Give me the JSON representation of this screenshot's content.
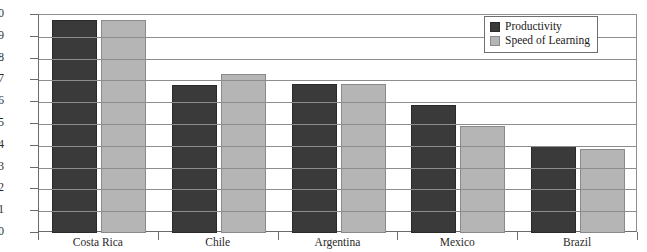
{
  "chart_data": {
    "type": "bar",
    "title": "",
    "subtitle": "",
    "xlabel": "",
    "ylabel": "",
    "ylim": [
      0,
      10
    ],
    "ytick_step": 1,
    "yticks": [
      "10",
      "9",
      "8",
      "7",
      "6",
      "5",
      "4",
      "3",
      "2",
      "1",
      "0"
    ],
    "grid": true,
    "legend_position": "top-right",
    "categories": [
      "Costa Rica",
      "Chile",
      "Argentina",
      "Mexico",
      "Brazil"
    ],
    "series": [
      {
        "name": "Productivity",
        "color": "#3a3a3a",
        "values": [
          9.75,
          6.8,
          6.85,
          5.85,
          4.0
        ]
      },
      {
        "name": "Speed of Learning",
        "color": "#b5b5b5",
        "values": [
          9.78,
          7.3,
          6.85,
          4.9,
          3.85
        ]
      }
    ]
  },
  "axis": {
    "grid_color": "#8d8d8d",
    "frame_color": "#6b6b6b"
  }
}
